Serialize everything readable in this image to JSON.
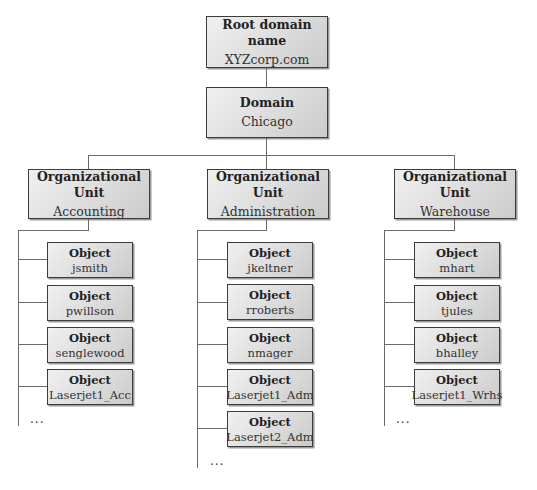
{
  "diagram": {
    "type": "active-directory-hierarchy",
    "root": {
      "title": "Root domain name",
      "name": "XYZcorp.com"
    },
    "domain": {
      "title": "Domain",
      "name": "Chicago"
    },
    "ous": [
      {
        "title": "Organizational Unit",
        "name": "Accounting",
        "objects": [
          {
            "title": "Object",
            "name": "jsmith"
          },
          {
            "title": "Object",
            "name": "pwillson"
          },
          {
            "title": "Object",
            "name": "senglewood"
          },
          {
            "title": "Object",
            "name": "Laserjet1_Acc"
          }
        ],
        "more": "..."
      },
      {
        "title": "Organizational Unit",
        "name": "Administration",
        "objects": [
          {
            "title": "Object",
            "name": "jkeltner"
          },
          {
            "title": "Object",
            "name": "rroberts"
          },
          {
            "title": "Object",
            "name": "nmager"
          },
          {
            "title": "Object",
            "name": "Laserjet1_Adm"
          },
          {
            "title": "Object",
            "name": "Laserjet2_Adm"
          }
        ],
        "more": "..."
      },
      {
        "title": "Organizational Unit",
        "name": "Warehouse",
        "objects": [
          {
            "title": "Object",
            "name": "mhart"
          },
          {
            "title": "Object",
            "name": "tjules"
          },
          {
            "title": "Object",
            "name": "bhalley"
          },
          {
            "title": "Object",
            "name": "Laserjet1_Wrhs"
          }
        ],
        "more": "..."
      }
    ],
    "colors": {
      "border": "#3c3c3c",
      "fill_light": "#f0f0f0",
      "fill_dark": "#cbcbcb",
      "connector": "#6a6a6a"
    }
  }
}
